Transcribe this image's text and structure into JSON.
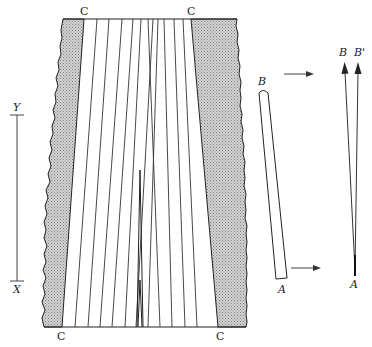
{
  "diagram": {
    "type": "schematic",
    "labels": {
      "corner_top_left": "C",
      "corner_top_right": "C",
      "corner_bottom_left": "C",
      "corner_bottom_right": "C",
      "scale_top": "Y",
      "scale_bottom": "X",
      "rod_top": "B",
      "rod_bottom": "A",
      "vector_tip_1": "B",
      "vector_tip_2": "B'",
      "vector_origin": "A"
    },
    "colors": {
      "line": "#222222",
      "shade": "#bdbdbd",
      "background": "#ffffff"
    }
  }
}
